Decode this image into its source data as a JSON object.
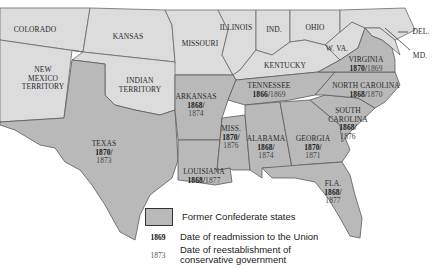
{
  "map": {
    "title": "Reconstruction: Former Confederate States",
    "non_confederate": [
      {
        "name": "COLORADO"
      },
      {
        "name": "KANSAS"
      },
      {
        "name": "MISSOURI"
      },
      {
        "name": "ILLINOIS"
      },
      {
        "name": "IND."
      },
      {
        "name": "OHIO"
      },
      {
        "name": "KENTUCKY"
      },
      {
        "name": "W. VA."
      },
      {
        "name": "NEW MEXICO TERRITORY",
        "lines": [
          "NEW",
          "MEXICO",
          "TERRITORY"
        ]
      },
      {
        "name": "INDIAN TERRITORY",
        "lines": [
          "INDIAN",
          "TERRITORY"
        ]
      },
      {
        "name": "DEL."
      },
      {
        "name": "MD."
      }
    ],
    "confederate": [
      {
        "name": "TEXAS",
        "readmission": "1870",
        "conservative": "1873"
      },
      {
        "name": "ARKANSAS",
        "readmission": "1868",
        "conservative": "1874"
      },
      {
        "name": "LOUISIANA",
        "readmission": "1868",
        "conservative": "1877"
      },
      {
        "name": "MISS.",
        "readmission": "1870",
        "conservative": "1876"
      },
      {
        "name": "ALABAMA",
        "readmission": "1868",
        "conservative": "1874"
      },
      {
        "name": "GEORGIA",
        "readmission": "1870",
        "conservative": "1871"
      },
      {
        "name": "FLA.",
        "readmission": "1868",
        "conservative": "1877"
      },
      {
        "name": "TENNESSEE",
        "readmission": "1866",
        "conservative": "1869"
      },
      {
        "name": "VIRGINIA",
        "readmission": "1870",
        "conservative": "1869"
      },
      {
        "name": "NORTH CAROLINA",
        "readmission": "1868",
        "conservative": "1870"
      },
      {
        "name": "SOUTH CAROLINA",
        "lines": [
          "SOUTH",
          "CAROLINA"
        ],
        "readmission": "1868",
        "conservative": "1876"
      }
    ],
    "colors": {
      "confederate_fill": "#b9b9b9",
      "union_fill": "#dcdcdc",
      "border": "#5a5a5a",
      "water": "#ffffff"
    }
  },
  "legend": {
    "swatch_label": "Former Confederate states",
    "readmission_sample": "1869",
    "readmission_label": "Date of readmission to the Union",
    "conservative_sample": "1873",
    "conservative_label_1": "Date of reestablishment of",
    "conservative_label_2": "conservative government"
  }
}
